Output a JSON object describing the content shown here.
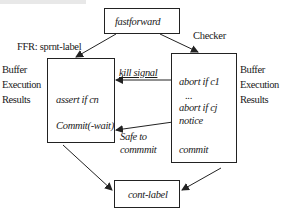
{
  "diagram": {
    "nodes": {
      "fastforward": {
        "label": "fastforward"
      },
      "ffr": {
        "title": "FFR: sprnt-label",
        "lines": [
          "assert if cn",
          "Commit(-wait)"
        ],
        "side_label": [
          "Buffer",
          "Execution",
          "Results"
        ]
      },
      "checker": {
        "title": "Checker",
        "lines": [
          "abort if c1",
          "...",
          "abort if cj",
          "notice",
          "commit"
        ],
        "side_label": [
          "Buffer",
          "Execution",
          "Results"
        ]
      },
      "cont_label": {
        "label": "cont-label"
      }
    },
    "edges": [
      {
        "from": "fastforward",
        "to": "ffr",
        "label": ""
      },
      {
        "from": "fastforward",
        "to": "checker",
        "label": ""
      },
      {
        "from": "checker",
        "to": "ffr",
        "label": "kill signal"
      },
      {
        "from": "checker",
        "to": "ffr",
        "label_lines": [
          "Safe to",
          "commmit"
        ]
      },
      {
        "from": "ffr",
        "to": "cont_label",
        "label": ""
      },
      {
        "from": "checker",
        "to": "cont_label",
        "label": ""
      }
    ],
    "colors": {
      "line": "#222222",
      "text": "#1a1a1a",
      "background": "#ffffff"
    }
  }
}
